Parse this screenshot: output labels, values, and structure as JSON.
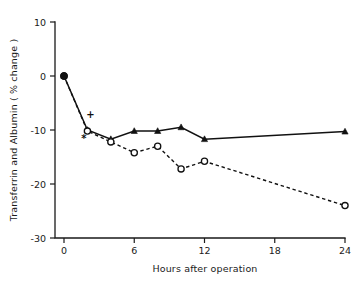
{
  "chart_data": {
    "type": "line",
    "title": "",
    "subtitle": "",
    "xlabel": "Hours after operation",
    "ylabel": "Transferrin and Albumin ( % change )",
    "xlim": [
      0,
      24
    ],
    "ylim": [
      -30,
      10
    ],
    "xticks": [
      0,
      6,
      12,
      18,
      24
    ],
    "xticklabels": [
      "0",
      "6",
      "12",
      "18",
      "24"
    ],
    "yticks": [
      10,
      0,
      -10,
      -20,
      -30
    ],
    "yticklabels": [
      "10",
      "0",
      "-10",
      "-20",
      "-30"
    ],
    "grid": false,
    "legend": "none",
    "series": [
      {
        "name": "Transferrin",
        "marker": "filled-triangle",
        "linestyle": "solid",
        "color": "#111111",
        "x": [
          0,
          2,
          4,
          6,
          8,
          10,
          12,
          24
        ],
        "values": [
          0.0,
          -10.0,
          -11.7,
          -10.2,
          -10.2,
          -9.5,
          -11.7,
          -10.3
        ]
      },
      {
        "name": "Albumin",
        "marker": "open-circle",
        "linestyle": "dashed",
        "color": "#111111",
        "x": [
          0,
          2,
          4,
          6,
          8,
          10,
          12,
          24
        ],
        "values": [
          0.0,
          -10.2,
          -12.2,
          -14.2,
          -13.0,
          -17.2,
          -15.8,
          -24.0
        ]
      }
    ],
    "annotations": [
      {
        "text": "+",
        "x": 2.25,
        "y": -7.8
      },
      {
        "text": "*",
        "x": 1.7,
        "y": -12.2
      }
    ]
  }
}
